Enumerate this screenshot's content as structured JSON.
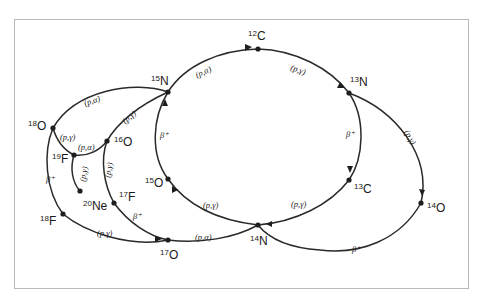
{
  "diagram": {
    "nuclei": [
      {
        "id": "c12",
        "mass": "12",
        "element": "C"
      },
      {
        "id": "n13",
        "mass": "13",
        "element": "N"
      },
      {
        "id": "c13",
        "mass": "13",
        "element": "C"
      },
      {
        "id": "n14",
        "mass": "14",
        "element": "N"
      },
      {
        "id": "o15",
        "mass": "15",
        "element": "O"
      },
      {
        "id": "n15",
        "mass": "15",
        "element": "N"
      },
      {
        "id": "o16",
        "mass": "16",
        "element": "O"
      },
      {
        "id": "f17",
        "mass": "17",
        "element": "F"
      },
      {
        "id": "o17",
        "mass": "17",
        "element": "O"
      },
      {
        "id": "f18",
        "mass": "18",
        "element": "F"
      },
      {
        "id": "o18",
        "mass": "18",
        "element": "O"
      },
      {
        "id": "f19",
        "mass": "19",
        "element": "F"
      },
      {
        "id": "ne20",
        "mass": "20",
        "element": "Ne"
      },
      {
        "id": "o14",
        "mass": "14",
        "element": "O"
      }
    ],
    "reactions": {
      "n15_c12": "(p,α)",
      "c12_n13": "(p,γ)",
      "n13_c13": "β⁺",
      "c13_n14": "(p,γ)",
      "n14_o15": "(p,γ)",
      "o15_n15": "β⁺",
      "n15_o16": "(p,γ)",
      "o16_f17": "(p,γ)",
      "f17_o17": "β⁺",
      "o17_n14": "(p,α)",
      "o17_f18": "(p,γ)",
      "f18_o18": "β⁺",
      "o18_n15": "(p,α)",
      "o18_f19": "(p,γ)",
      "f19_o16": "(p,α)",
      "f19_ne20": "(p,γ)",
      "n13_o14": "(p,γ)",
      "o14_n14": "β⁺"
    }
  }
}
